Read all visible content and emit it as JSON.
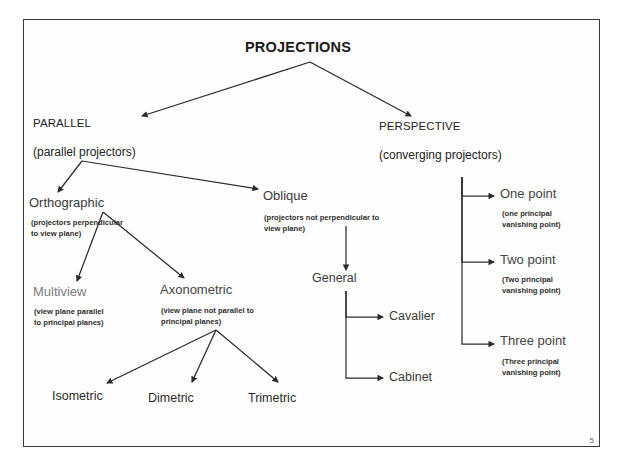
{
  "slide": {
    "page_number": "5",
    "title": "PROJECTIONS",
    "frame_color": "#3a3a3a"
  },
  "branches": {
    "parallel": {
      "label": "PARALLEL",
      "sub": "(parallel projectors)"
    },
    "perspective": {
      "label": "PERSPECTIVE",
      "sub": "(converging projectors)"
    }
  },
  "nodes": {
    "orthographic": {
      "label": "Orthographic",
      "caption": "(projectors perpendicular\nto view plane)"
    },
    "oblique": {
      "label": "Oblique",
      "caption": "(projectors not perpendicular to\nview plane)"
    },
    "multiview": {
      "label": "Multiview",
      "caption": "(view plane parallel\nto principal planes)"
    },
    "axonometric": {
      "label": "Axonometric",
      "caption": "(view plane not parallel to\nprincipal planes)"
    },
    "isometric": {
      "label": "Isometric"
    },
    "dimetric": {
      "label": "Dimetric"
    },
    "trimetric": {
      "label": "Trimetric"
    },
    "general": {
      "label": "General"
    },
    "cavalier": {
      "label": "Cavalier"
    },
    "cabinet": {
      "label": "Cabinet"
    },
    "one_point": {
      "label": "One point",
      "caption": "(one principal\nvanishing point)"
    },
    "two_point": {
      "label": "Two point",
      "caption": "(Two principal\nvanishing point)"
    },
    "three_point": {
      "label": "Three point",
      "caption": "(Three principal\nvanishing point)"
    }
  },
  "connectors": [
    {
      "name": "projections-to-parallel"
    },
    {
      "name": "projections-to-perspective"
    },
    {
      "name": "parallel-to-orthographic"
    },
    {
      "name": "parallel-to-oblique"
    },
    {
      "name": "orthographic-to-multiview"
    },
    {
      "name": "orthographic-to-axonometric"
    },
    {
      "name": "axonometric-to-isometric"
    },
    {
      "name": "axonometric-to-dimetric"
    },
    {
      "name": "axonometric-to-trimetric"
    },
    {
      "name": "oblique-to-general"
    },
    {
      "name": "general-to-cavalier"
    },
    {
      "name": "general-to-cabinet"
    },
    {
      "name": "perspective-to-one-point"
    },
    {
      "name": "perspective-to-two-point"
    },
    {
      "name": "perspective-to-three-point"
    }
  ]
}
